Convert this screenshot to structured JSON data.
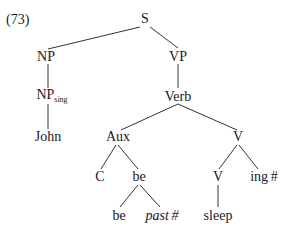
{
  "example_number": "(73)",
  "tree": {
    "S": "S",
    "NP": "NP",
    "VP": "VP",
    "NP_sing": {
      "base": "NP",
      "subscript": "sing"
    },
    "Verb": "Verb",
    "John": "John",
    "Aux": "Aux",
    "V_upper": "V",
    "C": "C",
    "be_mid": "be",
    "V_lower": "V",
    "ing": "ing #",
    "be_leaf": "be",
    "past": "past #",
    "sleep": "sleep"
  },
  "edges": [
    [
      "S",
      "NP"
    ],
    [
      "S",
      "VP"
    ],
    [
      "NP",
      "NP_sing"
    ],
    [
      "NP_sing",
      "John"
    ],
    [
      "VP",
      "Verb"
    ],
    [
      "Verb",
      "Aux"
    ],
    [
      "Verb",
      "V_upper"
    ],
    [
      "Aux",
      "C"
    ],
    [
      "Aux",
      "be_mid"
    ],
    [
      "be_mid",
      "be_leaf"
    ],
    [
      "be_mid",
      "past"
    ],
    [
      "V_upper",
      "V_lower"
    ],
    [
      "V_upper",
      "ing"
    ],
    [
      "V_lower",
      "sleep"
    ]
  ]
}
